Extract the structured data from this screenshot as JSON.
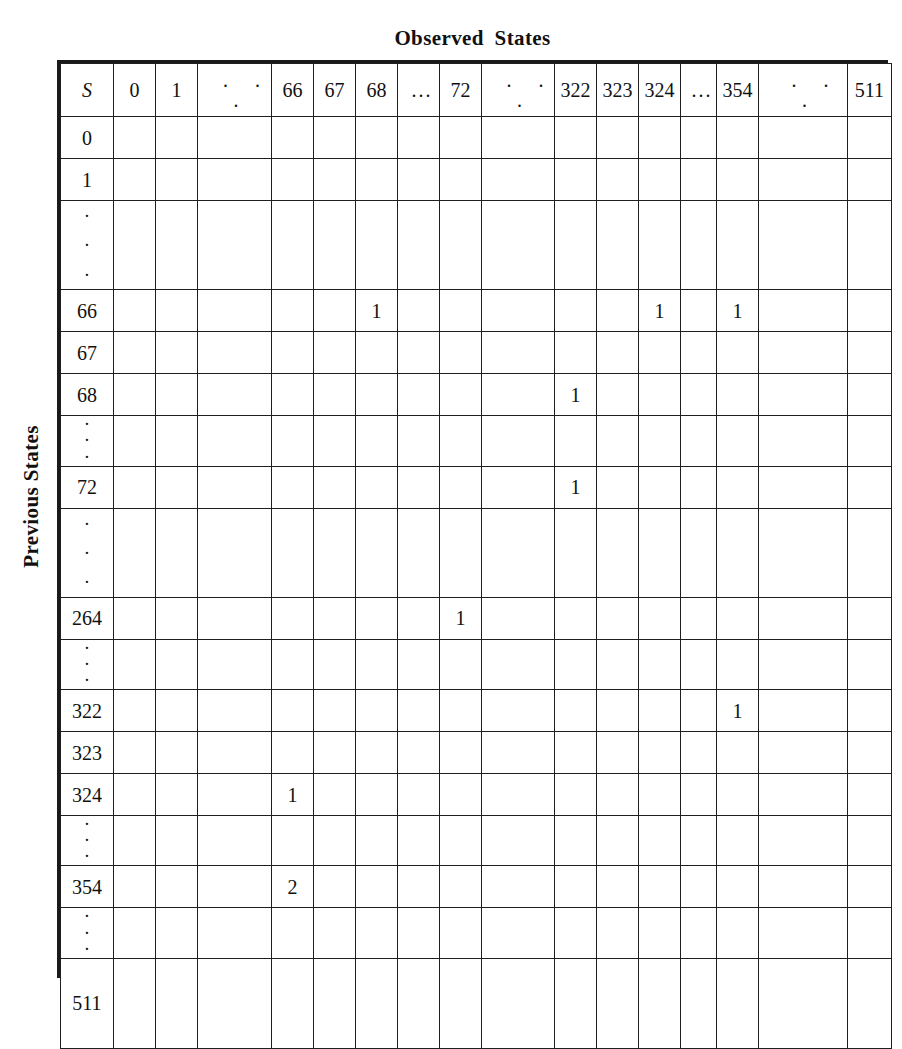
{
  "figure": {
    "column_axis_title": "Observed  States",
    "row_axis_title": "Previous States",
    "corner_label": "S",
    "ellipsis_horizontal": ". . .",
    "ellipsis_horizontal_tight": "...",
    "ellipsis_vertical": "·",
    "shaded_cell_color": "#c9c9c9",
    "grid_line_color": "#1f1f1f",
    "border_color": "#151515",
    "background_color": "#ffffff"
  },
  "chart_data": {
    "type": "heatmap",
    "title": "Observed  States",
    "xlabel": "Observed  States",
    "ylabel": "Previous States",
    "corner_label": "S",
    "columns": [
      "0",
      "1",
      ". . .",
      "66",
      "67",
      "68",
      "...",
      "72",
      ". . .",
      "322",
      "323",
      "324",
      "...",
      "354",
      ". . .",
      "511"
    ],
    "column_kinds": [
      "value",
      "value",
      "gap",
      "value",
      "value",
      "value",
      "gap",
      "value",
      "gap",
      "value",
      "value",
      "value",
      "gap",
      "value",
      "gap",
      "value"
    ],
    "rows": [
      "0",
      "1",
      "vdots",
      "66",
      "67",
      "68",
      "vdots",
      "72",
      "vdots",
      "264",
      "vdots",
      "322",
      "323",
      "324",
      "vdots",
      "354",
      "vdots",
      "511"
    ],
    "row_kinds": [
      "value",
      "value",
      "gap",
      "value",
      "value",
      "value",
      "gap",
      "value",
      "gap",
      "value",
      "gap",
      "value",
      "value",
      "value",
      "gap",
      "value",
      "gap",
      "value"
    ],
    "entries": [
      {
        "row": "66",
        "column": "68",
        "value": "1"
      },
      {
        "row": "66",
        "column": "324",
        "value": "1"
      },
      {
        "row": "66",
        "column": "354",
        "value": "1"
      },
      {
        "row": "68",
        "column": "322",
        "value": "1"
      },
      {
        "row": "72",
        "column": "322",
        "value": "1"
      },
      {
        "row": "264",
        "column": "72",
        "value": "1"
      },
      {
        "row": "322",
        "column": "354",
        "value": "1"
      },
      {
        "row": "324",
        "column": "66",
        "value": "1"
      },
      {
        "row": "354",
        "column": "66",
        "value": "2"
      }
    ]
  }
}
